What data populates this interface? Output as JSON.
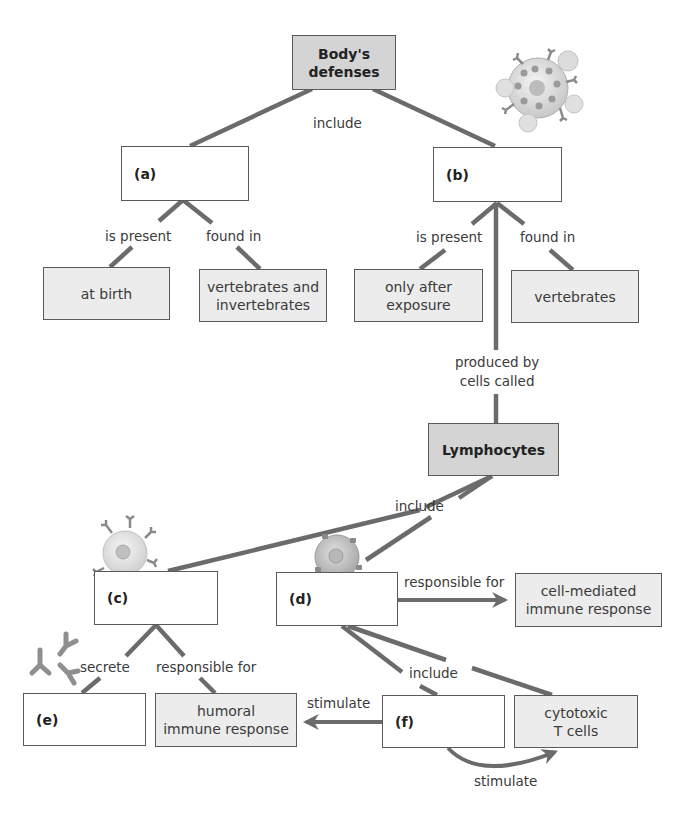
{
  "concept_map": {
    "root": {
      "label": "Body's\ndefenses",
      "line1": "Body's",
      "line2": "defenses"
    },
    "nodes": {
      "a": {
        "label": "(a)"
      },
      "b": {
        "label": "(b)"
      },
      "c": {
        "label": "(c)"
      },
      "d": {
        "label": "(d)"
      },
      "e": {
        "label": "(e)"
      },
      "f": {
        "label": "(f)"
      },
      "at_birth": {
        "label": "at birth"
      },
      "vert_invert": {
        "line1": "vertebrates and",
        "line2": "invertebrates"
      },
      "only_after": {
        "line1": "only after",
        "line2": "exposure"
      },
      "vertebrates": {
        "label": "vertebrates"
      },
      "lymphocytes": {
        "label": "Lymphocytes"
      },
      "cell_mediated": {
        "line1": "cell-mediated",
        "line2": "immune response"
      },
      "humoral": {
        "line1": "humoral",
        "line2": "immune response"
      },
      "cytotoxic": {
        "line1": "cytotoxic",
        "line2": "T cells"
      }
    },
    "links": {
      "include_top": "include",
      "a_is_present": "is present",
      "a_found_in": "found in",
      "b_is_present": "is present",
      "b_found_in": "found in",
      "produced_by_1": "produced by",
      "produced_by_2": "cells called",
      "include_lymph": "include",
      "d_responsible": "responsible for",
      "c_secrete": "secrete",
      "c_responsible": "responsible for",
      "include_d": "include",
      "f_stimulate_left": "stimulate",
      "f_stimulate_bottom": "stimulate"
    },
    "colors": {
      "line": "#6b6b6b",
      "box_border": "#5a5a5a",
      "box_fill_light": "#ececec",
      "box_fill_dark": "#d4d4d4"
    }
  }
}
